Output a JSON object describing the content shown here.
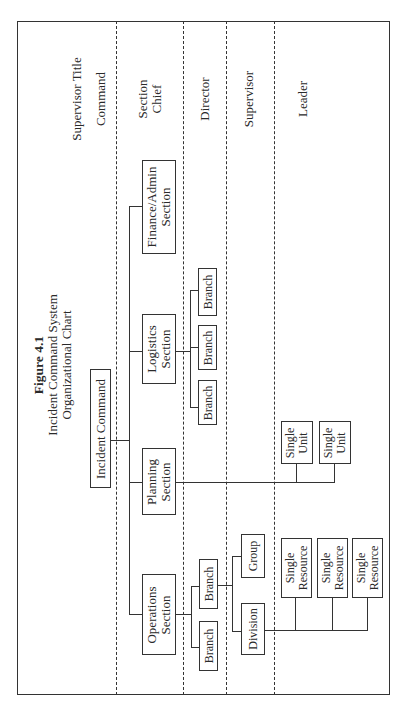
{
  "figure": {
    "number": "Figure 4.1",
    "title_line1": "Incident Command System",
    "title_line2": "Organizational Chart"
  },
  "levels": {
    "header": "Supervisor Title",
    "command": "Command",
    "section_chief_1": "Section",
    "section_chief_2": "Chief",
    "director": "Director",
    "supervisor": "Supervisor",
    "leader": "Leader"
  },
  "nodes": {
    "incident_command": "Incident Command",
    "finance": {
      "line1": "Finance/Admin",
      "line2": "Section"
    },
    "logistics": {
      "line1": "Logistics",
      "line2": "Section"
    },
    "planning": {
      "line1": "Planning",
      "line2": "Section"
    },
    "operations": {
      "line1": "Operations",
      "line2": "Section"
    },
    "logistics_branches": [
      "Branch",
      "Branch",
      "Branch"
    ],
    "operations_branches": [
      "Branch",
      "Branch"
    ],
    "group": "Group",
    "division": "Division",
    "single_units": [
      {
        "line1": "Single",
        "line2": "Unit"
      },
      {
        "line1": "Single",
        "line2": "Unit"
      }
    ],
    "single_resources": [
      {
        "line1": "Single",
        "line2": "Resource"
      },
      {
        "line1": "Single",
        "line2": "Resource"
      },
      {
        "line1": "Single",
        "line2": "Resource"
      }
    ]
  }
}
